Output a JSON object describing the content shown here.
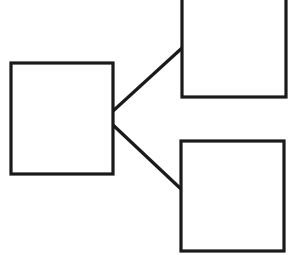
{
  "diagram": {
    "type": "tree",
    "stroke_color": "#1a1a1a",
    "background": "#ffffff",
    "nodes": [
      {
        "id": "root",
        "label": "",
        "x": 11,
        "y": 63,
        "w": 102,
        "h": 111
      },
      {
        "id": "child-top",
        "label": "",
        "x": 182,
        "y": -3,
        "w": 104,
        "h": 100
      },
      {
        "id": "child-bottom",
        "label": "",
        "x": 181,
        "y": 141,
        "w": 103,
        "h": 110
      }
    ],
    "edges": [
      {
        "from": "root",
        "to": "child-top",
        "x1": 113,
        "y1": 111,
        "x2": 182,
        "y2": 48
      },
      {
        "from": "root",
        "to": "child-bottom",
        "x1": 113,
        "y1": 125,
        "x2": 181,
        "y2": 189
      }
    ]
  }
}
